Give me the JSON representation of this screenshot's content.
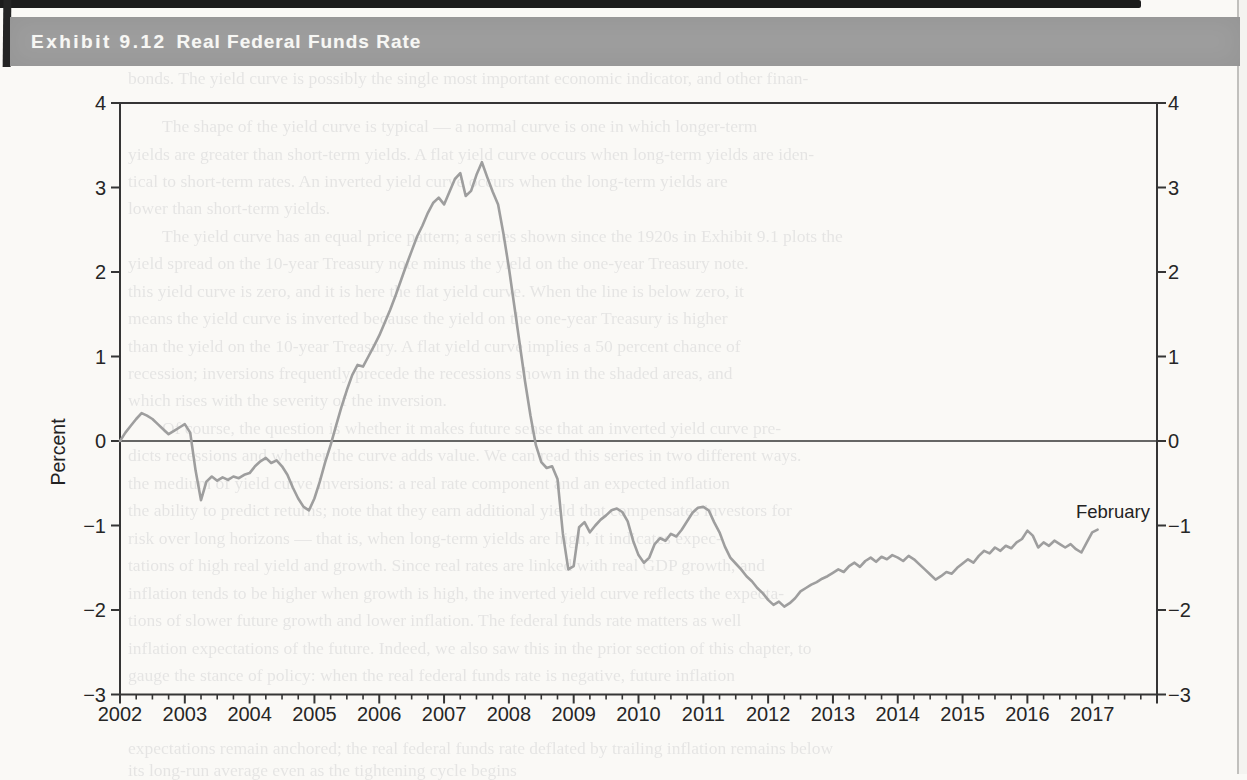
{
  "page": {
    "header": {
      "exhibit_label": "Exhibit 9.12",
      "title": "Real Federal Funds Rate"
    },
    "colors": {
      "header_bg": "#9d9d9d",
      "header_text": "#f7f7f4",
      "axis": "#353535",
      "line": "#9e9e9e",
      "page_bg": "#faf9f6"
    }
  },
  "chart_data": {
    "type": "line",
    "title": "Real Federal Funds Rate",
    "xlabel": "",
    "ylabel": "Percent",
    "ylim": [
      -3,
      4
    ],
    "xlim": [
      2002,
      2018
    ],
    "grid": false,
    "legend": "none",
    "y_ticks": [
      4,
      3,
      2,
      1,
      0,
      -1,
      -2,
      -3
    ],
    "x_ticks": [
      "2002",
      "2003",
      "2004",
      "2005",
      "2006",
      "2007",
      "2008",
      "2009",
      "2010",
      "2011",
      "2012",
      "2013",
      "2014",
      "2015",
      "2016",
      "2017"
    ],
    "minor_x_ticks_per_year": 4,
    "annotation": {
      "text": "February",
      "x": 2017.08,
      "y": -0.85
    },
    "series": [
      {
        "name": "Real federal funds rate (percent)",
        "frequency": "monthly",
        "start": "2002-01",
        "end": "2017-02",
        "values": [
          0.0,
          0.1,
          0.18,
          0.26,
          0.33,
          0.3,
          0.26,
          0.2,
          0.14,
          0.08,
          0.12,
          0.16,
          0.2,
          0.1,
          -0.35,
          -0.7,
          -0.48,
          -0.42,
          -0.47,
          -0.43,
          -0.46,
          -0.42,
          -0.44,
          -0.4,
          -0.38,
          -0.3,
          -0.24,
          -0.2,
          -0.26,
          -0.23,
          -0.3,
          -0.4,
          -0.55,
          -0.68,
          -0.78,
          -0.82,
          -0.68,
          -0.48,
          -0.25,
          -0.05,
          0.18,
          0.4,
          0.6,
          0.78,
          0.9,
          0.88,
          1.0,
          1.12,
          1.25,
          1.4,
          1.55,
          1.72,
          1.9,
          2.08,
          2.25,
          2.42,
          2.55,
          2.7,
          2.82,
          2.88,
          2.8,
          2.95,
          3.1,
          3.17,
          2.9,
          2.96,
          3.15,
          3.3,
          3.12,
          2.95,
          2.8,
          2.45,
          2.05,
          1.6,
          1.15,
          0.7,
          0.3,
          -0.05,
          -0.25,
          -0.32,
          -0.3,
          -0.45,
          -1.1,
          -1.52,
          -1.48,
          -1.02,
          -0.96,
          -1.08,
          -1.0,
          -0.93,
          -0.88,
          -0.82,
          -0.8,
          -0.84,
          -0.95,
          -1.18,
          -1.35,
          -1.44,
          -1.38,
          -1.22,
          -1.15,
          -1.18,
          -1.1,
          -1.13,
          -1.05,
          -0.95,
          -0.85,
          -0.79,
          -0.78,
          -0.82,
          -0.96,
          -1.08,
          -1.25,
          -1.38,
          -1.45,
          -1.52,
          -1.6,
          -1.66,
          -1.74,
          -1.8,
          -1.88,
          -1.94,
          -1.9,
          -1.96,
          -1.92,
          -1.86,
          -1.78,
          -1.74,
          -1.7,
          -1.67,
          -1.63,
          -1.6,
          -1.56,
          -1.52,
          -1.55,
          -1.48,
          -1.44,
          -1.49,
          -1.42,
          -1.38,
          -1.43,
          -1.37,
          -1.4,
          -1.35,
          -1.38,
          -1.42,
          -1.36,
          -1.4,
          -1.46,
          -1.52,
          -1.58,
          -1.64,
          -1.6,
          -1.55,
          -1.57,
          -1.5,
          -1.45,
          -1.4,
          -1.44,
          -1.36,
          -1.3,
          -1.33,
          -1.26,
          -1.3,
          -1.24,
          -1.27,
          -1.2,
          -1.16,
          -1.06,
          -1.12,
          -1.26,
          -1.2,
          -1.24,
          -1.18,
          -1.22,
          -1.26,
          -1.22,
          -1.28,
          -1.32,
          -1.2,
          -1.08,
          -1.05
        ]
      }
    ]
  },
  "ghost_text": {
    "lines": [
      {
        "t": 70,
        "l": 128,
        "text": "bonds. The yield curve is possibly the single most important economic indicator, and other finan-"
      },
      {
        "t": 118,
        "l": 162,
        "text": "The shape of the yield curve is typical — a normal curve is one in which longer-term"
      },
      {
        "t": 146,
        "l": 128,
        "text": "yields are greater than short-term yields. A flat yield curve occurs when long-term yields are iden-"
      },
      {
        "t": 173,
        "l": 128,
        "text": "tical to short-term rates. An inverted yield curve occurs when the long-term yields are"
      },
      {
        "t": 200,
        "l": 128,
        "text": "lower than short-term yields."
      },
      {
        "t": 228,
        "l": 162,
        "text": "The yield curve has an equal price pattern; a series shown since the 1920s in Exhibit 9.1 plots the"
      },
      {
        "t": 255,
        "l": 128,
        "text": "yield spread on the 10-year Treasury note minus the yield on the one-year Treasury note."
      },
      {
        "t": 283,
        "l": 128,
        "text": "this yield curve is zero, and it is here the flat yield curve. When the line is below zero, it"
      },
      {
        "t": 310,
        "l": 128,
        "text": "means the yield curve is inverted because the yield on the one-year Treasury is higher"
      },
      {
        "t": 338,
        "l": 128,
        "text": "than the yield on the 10-year Treasury. A flat yield curve implies a 50 percent chance of"
      },
      {
        "t": 365,
        "l": 128,
        "text": "recession; inversions frequently precede the recessions shown in the shaded areas, and"
      },
      {
        "t": 392,
        "l": 128,
        "text": "which rises with the severity of the inversion."
      },
      {
        "t": 420,
        "l": 162,
        "text": "Of course, the question is whether it makes future sense that an inverted yield curve pre-"
      },
      {
        "t": 447,
        "l": 128,
        "text": "dicts recessions and whether the curve adds value. We can read this series in two different ways."
      },
      {
        "t": 475,
        "l": 128,
        "text": "the medium of yield curve inversions: a real rate component and an expected inflation"
      },
      {
        "t": 502,
        "l": 128,
        "text": "the ability to predict returns; note that they earn additional yield that compensates investors for"
      },
      {
        "t": 530,
        "l": 128,
        "text": "risk over long horizons — that is, when long-term yields are high, it indicates expec-"
      },
      {
        "t": 557,
        "l": 128,
        "text": "tations of high real yield and growth. Since real rates are linked with real GDP growth, and"
      },
      {
        "t": 585,
        "l": 128,
        "text": "inflation tends to be higher when growth is high, the inverted yield curve reflects the expecta-"
      },
      {
        "t": 612,
        "l": 128,
        "text": "tions of slower future growth and lower inflation. The federal funds rate matters as well"
      },
      {
        "t": 640,
        "l": 128,
        "text": "inflation expectations of the future. Indeed, we also saw this in the prior section of this chapter, to"
      },
      {
        "t": 667,
        "l": 128,
        "text": "gauge the stance of policy: when the real federal funds rate is negative, future inflation"
      },
      {
        "t": 740,
        "l": 128,
        "text": "expectations remain anchored; the real federal funds rate deflated by trailing inflation remains below"
      },
      {
        "t": 762,
        "l": 128,
        "text": "its long-run average even as the tightening cycle begins"
      }
    ]
  }
}
